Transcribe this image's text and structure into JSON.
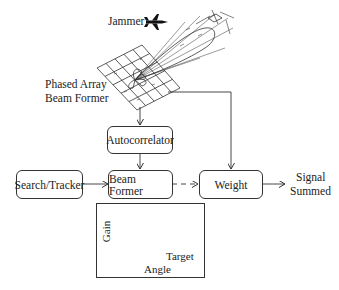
{
  "diagram": {
    "jammer_label": "Jammer",
    "phased_array_label_line1": "Phased Array",
    "phased_array_label_line2": "Beam Former",
    "blocks": {
      "autocorrelator": "Autocorrelator",
      "search_tracker": "Search/Tracker",
      "beam_former": "Beam Former",
      "weight": "Weight"
    },
    "output_label_line1": "Signal",
    "output_label_line2": "Summed",
    "inset_graph": {
      "y_label": "Gain",
      "x_label": "Angle",
      "peak_label": "Target"
    },
    "connections": [
      {
        "from": "phased_array",
        "to": "autocorrelator",
        "style": "solid"
      },
      {
        "from": "autocorrelator",
        "to": "beam_former",
        "style": "solid"
      },
      {
        "from": "search_tracker",
        "to": "beam_former",
        "style": "solid"
      },
      {
        "from": "beam_former",
        "to": "weight",
        "style": "dashed"
      },
      {
        "from": "phased_array",
        "to": "weight",
        "style": "solid"
      },
      {
        "from": "weight",
        "to": "signal_summed",
        "style": "solid"
      }
    ],
    "colors": {
      "line": "#333333",
      "background": "#ffffff"
    }
  }
}
